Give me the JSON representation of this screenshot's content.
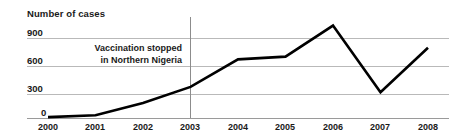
{
  "chart_data": {
    "type": "line",
    "title": "Number of cases",
    "xlabel": "",
    "ylabel": "Number of cases",
    "categories": [
      "2000",
      "2001",
      "2002",
      "2003",
      "2004",
      "2005",
      "2006",
      "2007",
      "2008"
    ],
    "x": [
      2000,
      2001,
      2002,
      2003,
      2004,
      2005,
      2006,
      2007,
      2008
    ],
    "series": [
      {
        "name": "Number of cases",
        "values": [
          10,
          30,
          170,
          350,
          660,
          690,
          1040,
          290,
          790
        ],
        "color": "#000000"
      }
    ],
    "ylim": [
      0,
      1100
    ],
    "yticks": [
      0,
      300,
      600,
      900
    ],
    "ytick_labels": [
      "0",
      "300",
      "600",
      "900"
    ],
    "grid": true,
    "legend": "none",
    "annotations": [
      {
        "text_line_1": "Vaccination stopped",
        "text_line_2": "in Northern Nigeria",
        "at_x": 2003,
        "marker": "vertical-line"
      }
    ]
  },
  "axis": {
    "y_title": "Number of cases",
    "y_labels": [
      "900",
      "600",
      "300",
      "0"
    ],
    "x_labels": [
      "2000",
      "2001",
      "2002",
      "2003",
      "2004",
      "2005",
      "2006",
      "2007",
      "2008"
    ]
  },
  "annotation": {
    "line1": "Vaccination stopped",
    "line2": "in Northern Nigeria"
  },
  "colors": {
    "series": "#000000",
    "grid": "#b9b9b9",
    "axis": "#9a9a9a",
    "marker": "#8c8c8c",
    "text": "#1a1a1a",
    "background": "#ffffff"
  }
}
